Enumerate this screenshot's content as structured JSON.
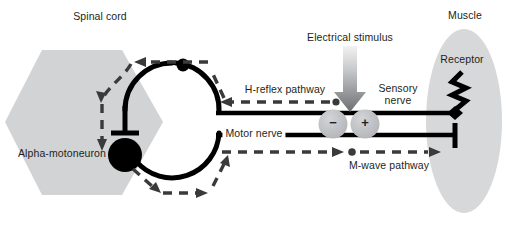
{
  "figure": {
    "width": 514,
    "height": 228,
    "background": "#ffffff"
  },
  "labels": {
    "spinal_cord": "Spinal cord",
    "alpha_motoneuron": "Alpha-motoneuron",
    "h_reflex_pathway": "H-reflex pathway",
    "electrical_stimulus": "Electrical stimulus",
    "sensory_nerve_line1": "Sensory",
    "sensory_nerve_line2": "nerve",
    "motor_nerve": "Motor nerve",
    "m_wave_pathway": "M-wave pathway",
    "muscle": "Muscle",
    "receptor": "Receptor",
    "cathode": "−",
    "anode": "+"
  },
  "colors": {
    "ink": "#231f20",
    "gray_fill": "#d2d3d5",
    "electrode_fill": "#bcbdc0",
    "muscle_fill": "#d7d8da",
    "stimulus_arrow_top": "#efefef",
    "stimulus_arrow_bottom": "#6e6f72",
    "background": "#ffffff"
  },
  "structures": {
    "spinal_cord_shape": "hexagon",
    "muscle_shape": "ellipse",
    "soma_shape": "filled-circle",
    "receptor_shape": "zigzag-spring",
    "interneuron_loop_shape": "open-circle-arc",
    "sensory_terminal_shape": "diamond",
    "motor_terminal_shape": "t-bar",
    "inhibitory_terminal_shape": "t-bar"
  },
  "pathways": [
    {
      "name": "h-reflex-pathway",
      "style": "dashed",
      "direction": "muscle-to-spinal-cord",
      "label": "H-reflex pathway"
    },
    {
      "name": "m-wave-pathway",
      "style": "dashed",
      "direction": "stimulus-to-muscle",
      "label": "M-wave pathway"
    },
    {
      "name": "sensory-nerve",
      "style": "solid",
      "direction": "muscle-to-spinal-cord",
      "label": "Sensory nerve"
    },
    {
      "name": "motor-nerve",
      "style": "solid",
      "direction": "spinal-cord-to-muscle",
      "label": "Motor nerve"
    }
  ],
  "electrodes": [
    {
      "name": "cathode",
      "polarity": "−"
    },
    {
      "name": "anode",
      "polarity": "+"
    }
  ]
}
